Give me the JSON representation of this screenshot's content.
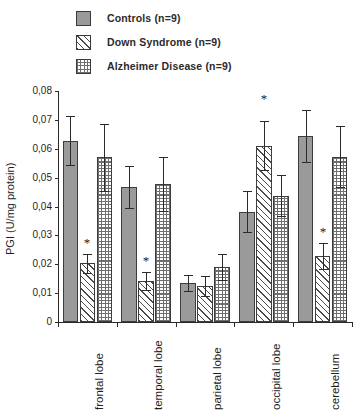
{
  "legend": {
    "items": [
      {
        "label": "Controls (n=9)",
        "pattern": "solid",
        "swatch_name": "legend-swatch-controls"
      },
      {
        "label": "Down Syndrome (n=9)",
        "pattern": "diagonal-hatch",
        "swatch_name": "legend-swatch-down-syndrome"
      },
      {
        "label": "Alzheimer Disease (n=9)",
        "pattern": "checkered",
        "swatch_name": "legend-swatch-alzheimer"
      }
    ]
  },
  "chart_data": {
    "type": "bar",
    "title": "",
    "xlabel": "",
    "ylabel": "PGI (U/mg protein)",
    "ylim": [
      0,
      0.08
    ],
    "ytick_values": [
      0,
      0.01,
      0.02,
      0.03,
      0.04,
      0.05,
      0.06,
      0.07,
      0.08
    ],
    "ytick_labels": [
      "0",
      "0,01",
      "0,02",
      "0,03",
      "0,04",
      "0,05",
      "0,06",
      "0,07",
      "0,08"
    ],
    "decimal_separator": ",",
    "grid": false,
    "legend_position": "top-left",
    "categories": [
      "frontal lobe",
      "temporal lobe",
      "parietal lobe",
      "occipital lobe",
      "cerebellum"
    ],
    "series": [
      {
        "name": "Controls (n=9)",
        "pattern": "solid",
        "values": [
          0.0627,
          0.0468,
          0.0135,
          0.0382,
          0.0643
        ],
        "errors": [
          0.0085,
          0.0072,
          0.0028,
          0.0072,
          0.009
        ],
        "significant": [
          false,
          false,
          false,
          false,
          false
        ]
      },
      {
        "name": "Down Syndrome (n=9)",
        "pattern": "diagonal-hatch",
        "values": [
          0.0203,
          0.0142,
          0.0125,
          0.061,
          0.0228
        ],
        "errors": [
          0.0033,
          0.003,
          0.0035,
          0.0085,
          0.0044
        ],
        "significant": [
          true,
          true,
          false,
          true,
          true
        ]
      },
      {
        "name": "Alzheimer Disease (n=9)",
        "pattern": "checkered",
        "values": [
          0.057,
          0.0478,
          0.019,
          0.0438,
          0.0573
        ],
        "errors": [
          0.0115,
          0.0092,
          0.0044,
          0.0071,
          0.0105
        ],
        "significant": [
          false,
          false,
          false,
          false,
          false
        ]
      }
    ],
    "annotations": [
      {
        "text": "*",
        "category": "frontal lobe",
        "series": "Down Syndrome (n=9)"
      },
      {
        "text": "*",
        "category": "temporal lobe",
        "series": "Down Syndrome (n=9)"
      },
      {
        "text": "*",
        "category": "occipital lobe",
        "series": "Down Syndrome (n=9)"
      },
      {
        "text": "*",
        "category": "cerebellum",
        "series": "Down Syndrome (n=9)"
      }
    ]
  }
}
